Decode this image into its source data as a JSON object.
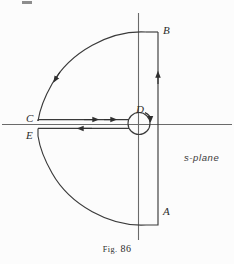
{
  "figure": {
    "caption_prefix": "Fig.",
    "caption_number": "86",
    "plane_label": "s-plane",
    "background_color": "#fcfcfc",
    "ink_color": "#3a3a3a",
    "axis_color": "#5a5a5a"
  },
  "points": {
    "A": {
      "label": "A",
      "x": 158,
      "y": 212
    },
    "B": {
      "label": "B",
      "x": 158,
      "y": 32
    },
    "C": {
      "label": "C",
      "x": 38,
      "y": 121
    },
    "D": {
      "label": "D",
      "x": 138,
      "y": 123
    },
    "E": {
      "label": "E",
      "x": 38,
      "y": 136
    }
  },
  "axes": {
    "real_axis": {
      "y": 124,
      "x_start": 2,
      "x_end": 232
    },
    "imaginary_axis": {
      "x": 138,
      "y_start": 13,
      "y_end": 240
    }
  },
  "contour": {
    "name": "bromwich-keyhole-contour",
    "segments": [
      {
        "name": "vertical-line-A-to-B",
        "type": "line",
        "from": "A",
        "to": "B",
        "direction": "up",
        "arrow": true
      },
      {
        "name": "upper-arc-B-to-C",
        "type": "arc",
        "from": "B",
        "to": "C",
        "direction": "counterclockwise",
        "arrow": true
      },
      {
        "name": "upper-branch-cut-C-to-D",
        "type": "line",
        "from": "C",
        "to": "D",
        "direction": "right",
        "arrow": true
      },
      {
        "name": "small-circle-around-D",
        "type": "circle",
        "center_x": 139,
        "center_y": 123,
        "radius": 11,
        "direction": "counterclockwise",
        "arrow": true
      },
      {
        "name": "lower-branch-cut-D-to-E",
        "type": "line",
        "from": "D",
        "to": "E",
        "direction": "left",
        "arrow": true
      },
      {
        "name": "lower-arc-E-to-A",
        "type": "arc",
        "from": "E",
        "to": "A",
        "direction": "counterclockwise",
        "arrow": false
      }
    ]
  }
}
